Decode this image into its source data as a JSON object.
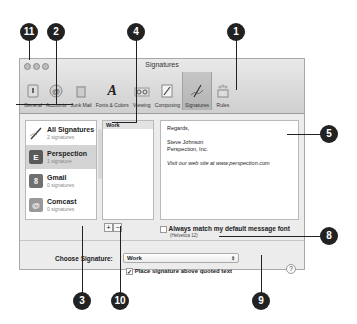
{
  "window": {
    "title": "Signatures",
    "toolbar": [
      {
        "label": "General",
        "icon": "general-switch-icon"
      },
      {
        "label": "Accounts",
        "icon": "at-sign-icon"
      },
      {
        "label": "Junk Mail",
        "icon": "trash-mail-icon"
      },
      {
        "label": "Fonts & Colors",
        "icon": "font-icon"
      },
      {
        "label": "Viewing",
        "icon": "glasses-icon"
      },
      {
        "label": "Composing",
        "icon": "pencil-paper-icon"
      },
      {
        "label": "Signatures",
        "icon": "signature-pen-icon",
        "active": true
      },
      {
        "label": "Rules",
        "icon": "rules-icon"
      }
    ]
  },
  "accounts": [
    {
      "name": "All Signatures",
      "sub": "2 signatures",
      "icon": "pen-icon"
    },
    {
      "name": "Perspection",
      "sub": "1 signature",
      "icon": "exchange-icon",
      "selected": true
    },
    {
      "name": "Gmail",
      "sub": "0 signatures",
      "icon": "google-icon"
    },
    {
      "name": "Comcast",
      "sub": "0 signatures",
      "icon": "comcast-icon"
    }
  ],
  "signatures": {
    "items": [
      "Work"
    ]
  },
  "editor": {
    "lines": [
      "Regards,",
      "",
      "Steve Johnson",
      "Perspection, Inc.",
      "",
      "Visit our web site at www.perspection.com"
    ]
  },
  "buttons": {
    "add": "+",
    "remove": "−",
    "help": "?"
  },
  "match_font": {
    "label": "Always match my default message font",
    "sub": "(Helvetica 12)",
    "checked": false
  },
  "choose_signature": {
    "label": "Choose Signature:",
    "value": "Work",
    "arrows": "⇕"
  },
  "place_above": {
    "label": "Place signature above quoted text",
    "checked": true
  },
  "callouts": [
    "1",
    "2",
    "3",
    "4",
    "5",
    "8",
    "9",
    "10",
    "11"
  ]
}
